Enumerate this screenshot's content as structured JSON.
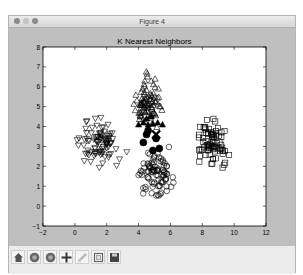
{
  "window": {
    "title": "Figure 4"
  },
  "toolbar": {
    "buttons": [
      {
        "name": "home-button",
        "icon": "home-icon"
      },
      {
        "name": "back-button",
        "icon": "back-icon"
      },
      {
        "name": "forward-button",
        "icon": "forward-icon"
      },
      {
        "name": "pan-button",
        "icon": "pan-icon"
      },
      {
        "name": "zoom-button",
        "icon": "zoom-icon"
      },
      {
        "name": "configure-subplots-button",
        "icon": "subplots-icon"
      },
      {
        "name": "save-button",
        "icon": "save-icon"
      }
    ]
  },
  "chart_data": {
    "type": "scatter",
    "title": "K Nearest Neighbors",
    "xlabel": "",
    "ylabel": "",
    "xlim": [
      -2,
      12
    ],
    "ylim": [
      -1,
      8
    ],
    "xticks": [
      -2,
      0,
      2,
      4,
      6,
      8,
      10,
      12
    ],
    "yticks": [
      -1,
      0,
      1,
      2,
      3,
      4,
      5,
      6,
      7,
      8
    ],
    "grid": false,
    "legend": null,
    "series": [
      {
        "name": "class-triangle-down",
        "marker": "v",
        "filled": false,
        "center": [
          1.5,
          3.2
        ],
        "spread": [
          0.9,
          0.7
        ],
        "count": 90
      },
      {
        "name": "class-triangle-up",
        "marker": "^",
        "filled": false,
        "center": [
          4.6,
          5.2
        ],
        "spread": [
          0.6,
          0.8
        ],
        "count": 90
      },
      {
        "name": "class-circle",
        "marker": "o",
        "filled": false,
        "center": [
          5.0,
          1.6
        ],
        "spread": [
          0.8,
          0.8
        ],
        "count": 90
      },
      {
        "name": "class-square",
        "marker": "s",
        "filled": false,
        "center": [
          8.6,
          3.2
        ],
        "spread": [
          0.6,
          0.7
        ],
        "count": 80
      }
    ],
    "query_point": {
      "marker": "x",
      "x": 5.1,
      "y": 3.6
    },
    "nearest_neighbors": [
      {
        "marker": "^",
        "x": 4.3,
        "y": 4.2
      },
      {
        "marker": "^",
        "x": 4.6,
        "y": 4.1
      },
      {
        "marker": "^",
        "x": 4.9,
        "y": 4.15
      },
      {
        "marker": "^",
        "x": 5.2,
        "y": 4.2
      },
      {
        "marker": "^",
        "x": 4.0,
        "y": 4.1
      },
      {
        "marker": "^",
        "x": 4.5,
        "y": 4.4
      },
      {
        "marker": "^",
        "x": 5.5,
        "y": 4.1
      },
      {
        "marker": "^",
        "x": 4.8,
        "y": 4.5
      },
      {
        "marker": "o",
        "x": 4.5,
        "y": 3.6
      },
      {
        "marker": "o",
        "x": 4.3,
        "y": 3.2
      },
      {
        "marker": "o",
        "x": 4.9,
        "y": 2.8
      },
      {
        "marker": "o",
        "x": 5.3,
        "y": 2.9
      },
      {
        "marker": "o",
        "x": 5.1,
        "y": 3.4
      },
      {
        "marker": "o",
        "x": 4.6,
        "y": 3.8
      }
    ]
  }
}
